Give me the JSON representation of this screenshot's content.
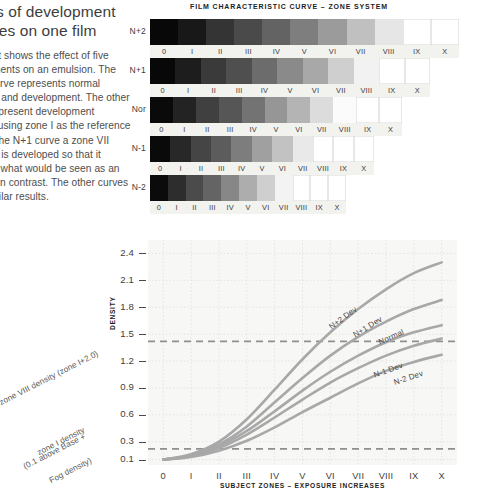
{
  "article": {
    "title": "Effects of development changes on one film",
    "body": "This chart shows the effect of five developments on an emulsion. The middle curve represents normal exposure and development. The other curves represent development changes using zone I as the reference point. In the N+1 curve a zone VII exposure is developed so that it becomes what would be seen as an increase in contrast. The other curves show similar results."
  },
  "chart_title": "FILM CHARACTERISTIC CURVE – ZONE SYSTEM",
  "zone_numerals": [
    "0",
    "I",
    "II",
    "III",
    "IV",
    "V",
    "VI",
    "VII",
    "VIII",
    "IX",
    "X"
  ],
  "strips": [
    {
      "label": "N+2",
      "width_px": 309,
      "grays": [
        "#080808",
        "#181818",
        "#343434",
        "#4a4a4a",
        "#636363",
        "#7e7e7e",
        "#9b9b9b",
        "#c0c0c0",
        "#e6e6e6",
        "#ffffff",
        "#ffffff"
      ]
    },
    {
      "label": "N+1",
      "width_px": 280,
      "grays": [
        "#080808",
        "#1d1d1d",
        "#3a3a3a",
        "#4f4f4f",
        "#6c6c6c",
        "#8a8a8a",
        "#a8a8a8",
        "#cfcfcf",
        "#f2f2f2",
        "#ffffff",
        "#ffffff"
      ]
    },
    {
      "label": "Nor",
      "width_px": 252,
      "grays": [
        "#0a0a0a",
        "#232323",
        "#404040",
        "#565656",
        "#737373",
        "#969696",
        "#b4b4b4",
        "#dcdcdc",
        "#fbfbfb",
        "#ffffff",
        "#ffffff"
      ]
    },
    {
      "label": "N-1",
      "width_px": 224,
      "grays": [
        "#0a0a0a",
        "#282828",
        "#454545",
        "#5c5c5c",
        "#7d7d7d",
        "#a0a0a0",
        "#c2c2c2",
        "#e9e9e9",
        "#ffffff",
        "#ffffff",
        "#ffffff"
      ]
    },
    {
      "label": "N-2",
      "width_px": 196,
      "grays": [
        "#0b0b0b",
        "#2d2d2d",
        "#4b4b4b",
        "#646464",
        "#878787",
        "#adadad",
        "#cfcfcf",
        "#f3f3f3",
        "#ffffff",
        "#ffffff",
        "#ffffff"
      ]
    }
  ],
  "chart_data": {
    "type": "line",
    "title": "FILM CHARACTERISTIC CURVE – ZONE SYSTEM",
    "xlabel": "SUBJECT ZONES – EXPOSURE INCREASES",
    "ylabel": "DENSITY",
    "x": [
      0,
      1,
      2,
      3,
      4,
      5,
      6,
      7,
      8,
      9,
      10
    ],
    "x_tick_labels": [
      "0",
      "I",
      "II",
      "III",
      "IV",
      "V",
      "VI",
      "VII",
      "VIII",
      "IX",
      "X"
    ],
    "y_tick_labels": [
      "0.1",
      "0.3",
      "0.6",
      "0.9",
      "1.2",
      "1.5",
      "1.8",
      "2.1",
      "2.4"
    ],
    "y_tick_values": [
      0.1,
      0.3,
      0.6,
      0.9,
      1.2,
      1.5,
      1.8,
      2.1,
      2.4
    ],
    "ylim": [
      0.04,
      2.55
    ],
    "xlim": [
      -0.55,
      10.55
    ],
    "grid": "dotted",
    "legend": "inline-labels",
    "reference_lines": [
      {
        "name": "zone I density line",
        "y": 0.22,
        "style": "dashed"
      },
      {
        "name": "zone VIII density line",
        "y": 1.42,
        "style": "dashed"
      }
    ],
    "annotations": [
      "zone VIII density (zone I+2.0)",
      "zone I density",
      "(0.1 above Base +",
      "Fog density)"
    ],
    "series": [
      {
        "name": "N+2 Dev",
        "values": [
          0.1,
          0.16,
          0.3,
          0.55,
          0.88,
          1.22,
          1.52,
          1.78,
          2.0,
          2.18,
          2.3
        ]
      },
      {
        "name": "N+1 Dev",
        "values": [
          0.1,
          0.15,
          0.27,
          0.47,
          0.74,
          1.01,
          1.26,
          1.47,
          1.64,
          1.78,
          1.88
        ]
      },
      {
        "name": "Normal",
        "values": [
          0.1,
          0.14,
          0.25,
          0.42,
          0.64,
          0.87,
          1.08,
          1.26,
          1.41,
          1.52,
          1.6
        ]
      },
      {
        "name": "N-1 Dev",
        "values": [
          0.1,
          0.14,
          0.23,
          0.38,
          0.57,
          0.77,
          0.96,
          1.12,
          1.26,
          1.37,
          1.45
        ]
      },
      {
        "name": "N-2 Dev",
        "values": [
          0.1,
          0.13,
          0.2,
          0.31,
          0.46,
          0.63,
          0.79,
          0.95,
          1.09,
          1.19,
          1.27
        ]
      }
    ],
    "colors": {
      "curve": "#a8a8a8",
      "reference_line": "#8f8f8f",
      "grid": "#e2e2de",
      "plot_background": "#f7f7f5",
      "text": "#3d3d3d"
    }
  }
}
